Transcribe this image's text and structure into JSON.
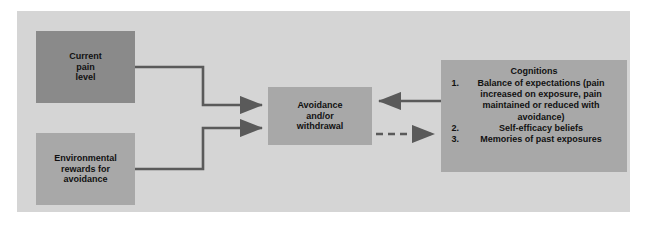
{
  "figure": {
    "background_color": "#ffffff",
    "panel_color": "#d5d5d5"
  },
  "nodes": {
    "current_pain": {
      "text": "Current\npain\nlevel",
      "color": "#8a8a8a"
    },
    "environmental_rewards": {
      "text": "Environmental\nrewards for\navoidance",
      "color": "#a8a8a8"
    },
    "avoidance": {
      "text": "Avoidance\nand/or\nwithdrawal",
      "color": "#a8a8a8"
    },
    "cognitions": {
      "title": "Cognitions",
      "color": "#a8a8a8",
      "items": [
        {
          "number": "1.",
          "text": "Balance of expectations (pain increased on exposure, pain maintained or reduced with avoidance)"
        },
        {
          "number": "2.",
          "text": "Self-efficacy beliefs"
        },
        {
          "number": "3.",
          "text": "Memories of past exposures"
        }
      ]
    }
  },
  "connectors": {
    "line_color": "#5a5a5a",
    "items": [
      {
        "name": "current-pain-to-avoidance",
        "style": "solid",
        "direction": "right",
        "from": "current_pain",
        "to": "avoidance"
      },
      {
        "name": "environmental-rewards-to-avoidance",
        "style": "solid",
        "direction": "right",
        "from": "environmental_rewards",
        "to": "avoidance"
      },
      {
        "name": "cognitions-to-avoidance",
        "style": "solid",
        "direction": "left",
        "from": "cognitions",
        "to": "avoidance"
      },
      {
        "name": "avoidance-to-cognitions",
        "style": "dashed",
        "direction": "right",
        "from": "avoidance",
        "to": "cognitions"
      }
    ]
  }
}
